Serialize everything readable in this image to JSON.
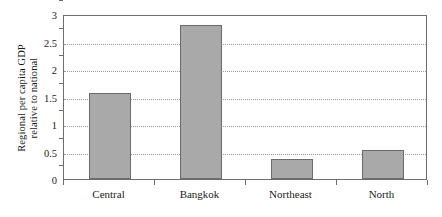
{
  "chart_data": {
    "type": "bar",
    "title": "",
    "xlabel": "",
    "ylabel_line1": "Regional per capita GDP",
    "ylabel_line2": "relative to national",
    "categories": [
      "Central",
      "Bangkok",
      "Northeast",
      "North"
    ],
    "values": [
      1.56,
      2.8,
      0.36,
      0.52
    ],
    "ylim": [
      0,
      3
    ],
    "yticks": [
      0,
      0.5,
      1,
      1.5,
      2,
      2.5,
      3
    ],
    "ytick_labels": [
      "0",
      "0.5",
      "1",
      "1.5",
      "2",
      "2.5",
      "3"
    ],
    "grid": true,
    "grid_axis": "y",
    "grid_style": "dotted",
    "legend": "none",
    "series": [
      {
        "name": "Regional per capita GDP relative to national",
        "values": [
          1.56,
          2.8,
          0.36,
          0.52
        ]
      }
    ]
  },
  "style": {
    "bar_fill": "#a9a9a9",
    "bar_border": "#6b6b6b",
    "frame_color": "#6e6e6e",
    "grid_color": "#9a9a9a",
    "background": "#ffffff",
    "text_color": "#1a1a1a"
  }
}
